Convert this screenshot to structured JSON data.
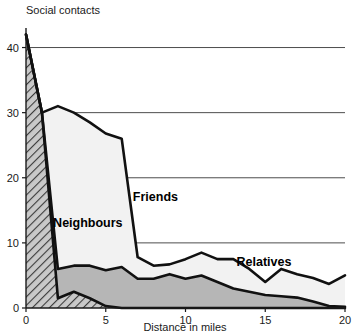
{
  "chart_data": {
    "type": "area",
    "title": "",
    "ylabel": "Social contacts",
    "xlabel": "Distance in miles",
    "stacked": true,
    "grid": true,
    "legend_position": "inline-annotations",
    "xlim": [
      0,
      20
    ],
    "ylim": [
      0,
      43
    ],
    "xticks": [
      0,
      5,
      10,
      15,
      20
    ],
    "yticks": [
      0,
      10,
      20,
      30,
      40
    ],
    "xtick_labels": [
      "0",
      "5",
      "10",
      "15",
      "20"
    ],
    "ytick_labels": [
      "0",
      "10",
      "20",
      "30",
      "40"
    ],
    "x": [
      0,
      1,
      2,
      3,
      4,
      5,
      6,
      7,
      8,
      9,
      10,
      11,
      12,
      13,
      14,
      15,
      16,
      17,
      18,
      19,
      20
    ],
    "series": [
      {
        "name": "Relatives",
        "fill": "dark-hatch",
        "values": [
          42,
          30,
          1.5,
          2.5,
          1.5,
          0.3,
          0,
          0,
          0,
          0,
          0,
          0,
          0,
          0,
          0,
          0,
          0,
          0,
          0,
          0,
          0
        ]
      },
      {
        "name": "Neighbours",
        "fill": "solid-grey",
        "values": [
          0,
          0,
          4.5,
          4.0,
          5.0,
          5.5,
          6.3,
          4.5,
          4.5,
          5.2,
          4.5,
          5.0,
          4.0,
          3.0,
          2.5,
          2.0,
          1.8,
          1.6,
          1.0,
          0.3,
          0.2
        ]
      },
      {
        "name": "Friends",
        "fill": "light",
        "values": [
          0,
          0,
          25,
          23.5,
          22,
          21,
          19.7,
          3.3,
          2.0,
          1.5,
          3.0,
          3.5,
          3.5,
          4.5,
          3.5,
          2.0,
          4.2,
          3.6,
          3.6,
          3.4,
          4.8
        ]
      }
    ],
    "totals": [
      42,
      30,
      31,
      27.5,
      28.5,
      26.8,
      26,
      7.8,
      6.5,
      6.7,
      7.5,
      8.5,
      7.5,
      7.5,
      6.0,
      4.0,
      6.0,
      5.2,
      4.6,
      3.7,
      5.0
    ],
    "annotations": [
      {
        "text": "Friends",
        "x": 6.7,
        "y": 16.5
      },
      {
        "text": "Neighbours",
        "x": 1.7,
        "y": 12.5
      },
      {
        "text": "Relatives",
        "x": 13.2,
        "y": 6.4
      }
    ]
  }
}
